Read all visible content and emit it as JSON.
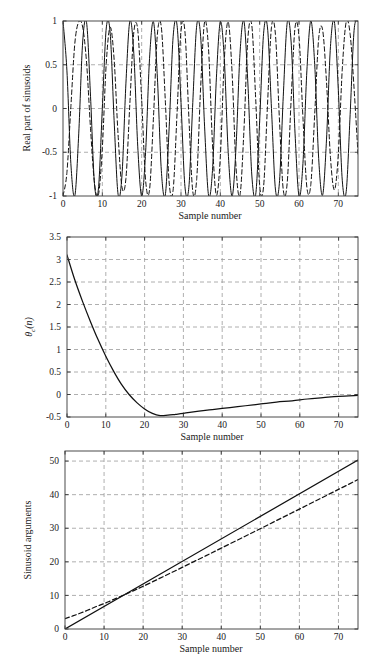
{
  "figure": {
    "panel_count": 3
  },
  "chart_data": [
    {
      "id": "panel-1",
      "type": "line",
      "title": "",
      "xlabel": "Sample number",
      "ylabel": "Real part of sinusoids",
      "xlim": [
        0,
        75
      ],
      "ylim": [
        -1,
        1
      ],
      "xticks": [
        0,
        10,
        20,
        30,
        40,
        50,
        60,
        70
      ],
      "xtick_labels": [
        "0",
        "10",
        "20",
        "30",
        "40",
        "50",
        "60",
        "70"
      ],
      "yticks": [
        -1,
        -0.5,
        0,
        0.5,
        1
      ],
      "ytick_labels": [
        "-1",
        "-0.5",
        "0",
        "0.5",
        "1"
      ],
      "grid": true,
      "legend": "none",
      "series": [
        {
          "name": "reference sinusoid",
          "style": "solid",
          "color": "#111111",
          "description": "cos of linearly increasing argument, constant frequency",
          "x": [
            0,
            1,
            2,
            3,
            4,
            5,
            6,
            7,
            8,
            9,
            10,
            11,
            12,
            13,
            14,
            15,
            16,
            17,
            18,
            19,
            20,
            21,
            22,
            23,
            24,
            25,
            26,
            27,
            28,
            29,
            30,
            31,
            32,
            33,
            34,
            35,
            36,
            37,
            38,
            39,
            40,
            41,
            42,
            43,
            44,
            45,
            46,
            47,
            48,
            49,
            50,
            51,
            52,
            53,
            54,
            55,
            56,
            57,
            58,
            59,
            60,
            61,
            62,
            63,
            64,
            65,
            66,
            67,
            68,
            69,
            70,
            71,
            72,
            73,
            74,
            75
          ],
          "y": [
            1.0,
            0.43,
            -0.63,
            -1.0,
            -0.29,
            0.76,
            0.98,
            0.14,
            -0.86,
            -0.92,
            0.0,
            0.92,
            0.86,
            -0.14,
            -0.98,
            -0.76,
            0.29,
            1.0,
            0.63,
            -0.43,
            -1.0,
            -0.5,
            0.57,
            0.99,
            0.35,
            -0.71,
            -0.99,
            -0.21,
            0.82,
            0.95,
            0.07,
            -0.89,
            -0.9,
            0.07,
            0.95,
            0.82,
            -0.21,
            -0.99,
            -0.71,
            0.35,
            0.99,
            0.57,
            -0.5,
            -1.0,
            -0.43,
            0.63,
            1.0,
            0.29,
            -0.76,
            -0.98,
            -0.14,
            0.86,
            0.92,
            0.0,
            -0.92,
            -0.86,
            0.14,
            0.98,
            0.76,
            -0.29,
            -1.0,
            -0.63,
            0.43,
            1.0,
            0.5,
            -0.57,
            -0.99,
            -0.35,
            0.71,
            0.99,
            0.21,
            -0.82,
            -0.95,
            -0.07,
            0.89,
            1.0
          ]
        },
        {
          "name": "chirped sinusoid",
          "style": "dashed",
          "color": "#111111",
          "description": "cos of argument with extra phase term theta_c(n), nearly identical after n≈15",
          "x": [
            0,
            1,
            2,
            3,
            4,
            5,
            6,
            7,
            8,
            9,
            10,
            11,
            12,
            13,
            14,
            15,
            16,
            17,
            18,
            19,
            20,
            21,
            22,
            23,
            24,
            25,
            26,
            27,
            28,
            29,
            30,
            31,
            32,
            33,
            34,
            35,
            36,
            37,
            38,
            39,
            40,
            41,
            42,
            43,
            44,
            45,
            46,
            47,
            48,
            49,
            50,
            51,
            52,
            53,
            54,
            55,
            56,
            57,
            58,
            59,
            60,
            61,
            62,
            63,
            64,
            65,
            66,
            67,
            68,
            69,
            70,
            71,
            72,
            73,
            74,
            75
          ],
          "y": [
            -1.0,
            -0.73,
            0.02,
            0.74,
            0.99,
            0.93,
            0.52,
            -0.23,
            -0.85,
            -0.99,
            -0.45,
            0.52,
            0.93,
            0.56,
            -0.3,
            -0.9,
            -0.8,
            0.06,
            0.87,
            0.9,
            0.1,
            -0.82,
            -0.93,
            -0.1,
            0.85,
            0.93,
            0.1,
            -0.85,
            -0.93,
            -0.05,
            0.89,
            0.88,
            -0.1,
            -0.95,
            -0.8,
            0.25,
            0.99,
            0.68,
            -0.4,
            -0.99,
            -0.55,
            0.55,
            0.99,
            0.4,
            -0.68,
            -0.99,
            -0.25,
            0.8,
            0.95,
            0.1,
            -0.88,
            -0.89,
            0.05,
            0.93,
            0.85,
            -0.1,
            -0.93,
            -0.85,
            0.1,
            0.93,
            0.82,
            -0.1,
            -0.9,
            -0.87,
            -0.06,
            0.8,
            0.9,
            0.3,
            -0.56,
            -0.93,
            -0.52,
            0.45,
            0.99,
            0.85,
            0.23,
            -0.52
          ]
        }
      ]
    },
    {
      "id": "panel-2",
      "type": "line",
      "title": "",
      "xlabel": "Sample number",
      "ylabel": "θc(n)",
      "ylabel_base": "θ",
      "ylabel_sub": "c",
      "ylabel_tail": "(n)",
      "xlim": [
        0,
        75
      ],
      "ylim": [
        -0.5,
        3.5
      ],
      "xticks": [
        0,
        10,
        20,
        30,
        40,
        50,
        60,
        70
      ],
      "xtick_labels": [
        "0",
        "10",
        "20",
        "30",
        "40",
        "50",
        "60",
        "70"
      ],
      "yticks": [
        -0.5,
        0,
        0.5,
        1,
        1.5,
        2,
        2.5,
        3,
        3.5
      ],
      "ytick_labels": [
        "-0.5",
        "0",
        "0.5",
        "1",
        "1.5",
        "2",
        "2.5",
        "3",
        "3.5"
      ],
      "grid": true,
      "legend": "none",
      "series": [
        {
          "name": "theta_c(n)",
          "style": "solid",
          "color": "#111111",
          "description": "decays from 3.1 at n=0, crosses zero near n=14, minimum about -0.47 near n=24, then rises asymptotically to 0",
          "x": [
            0,
            2,
            4,
            6,
            8,
            10,
            12,
            14,
            16,
            18,
            20,
            22,
            24,
            26,
            28,
            30,
            34,
            38,
            42,
            46,
            50,
            54,
            58,
            62,
            66,
            70,
            75
          ],
          "y": [
            3.1,
            2.55,
            2.07,
            1.63,
            1.22,
            0.85,
            0.52,
            0.23,
            0.0,
            -0.18,
            -0.32,
            -0.42,
            -0.47,
            -0.46,
            -0.44,
            -0.42,
            -0.37,
            -0.33,
            -0.29,
            -0.25,
            -0.21,
            -0.17,
            -0.14,
            -0.1,
            -0.07,
            -0.04,
            -0.02
          ]
        }
      ]
    },
    {
      "id": "panel-3",
      "type": "line",
      "title": "",
      "xlabel": "Sample number",
      "ylabel": "Sinusoid arguments",
      "xlim": [
        0,
        75
      ],
      "ylim": [
        0,
        53
      ],
      "xticks": [
        0,
        10,
        20,
        30,
        40,
        50,
        60,
        70
      ],
      "xtick_labels": [
        "0",
        "10",
        "20",
        "30",
        "40",
        "50",
        "60",
        "70"
      ],
      "yticks": [
        0,
        10,
        20,
        30,
        40,
        50
      ],
      "ytick_labels": [
        "0",
        "10",
        "20",
        "30",
        "40",
        "50"
      ],
      "grid": true,
      "legend": "none",
      "series": [
        {
          "name": "linear argument",
          "style": "solid",
          "color": "#111111",
          "description": "straight line from (0,0) to (75,50.3)",
          "x": [
            0,
            75
          ],
          "y": [
            0.0,
            50.3
          ]
        },
        {
          "name": "modified argument",
          "style": "dashed",
          "color": "#111111",
          "description": "starts at about 3.1 at n=0, merges with the linear line near n=10 and stays close to it",
          "x": [
            0,
            2,
            4,
            6,
            8,
            10,
            12,
            14,
            16,
            18,
            20,
            24,
            28,
            32,
            36,
            40,
            46,
            52,
            58,
            64,
            70,
            75
          ],
          "y": [
            3.1,
            3.89,
            4.76,
            5.7,
            6.69,
            7.55,
            8.57,
            9.58,
            10.6,
            11.66,
            12.73,
            14.95,
            17.21,
            19.49,
            21.78,
            24.08,
            27.55,
            31.04,
            34.54,
            38.05,
            41.56,
            44.5
          ]
        }
      ]
    }
  ]
}
